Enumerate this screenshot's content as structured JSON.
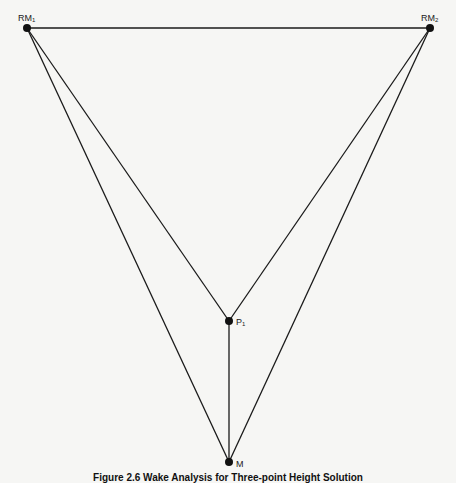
{
  "nodes": {
    "rm1": {
      "label": "RM",
      "sub": "1",
      "x": 27,
      "y": 28
    },
    "rm2": {
      "label": "RM",
      "sub": "2",
      "x": 430,
      "y": 28
    },
    "p1": {
      "label": "P",
      "sub": "1",
      "x": 229,
      "y": 321
    },
    "m": {
      "label": "M",
      "sub": "",
      "x": 229,
      "y": 462
    }
  },
  "edges": [
    [
      "rm1",
      "rm2"
    ],
    [
      "rm1",
      "p1"
    ],
    [
      "rm1",
      "m"
    ],
    [
      "rm2",
      "p1"
    ],
    [
      "rm2",
      "m"
    ],
    [
      "p1",
      "m"
    ]
  ],
  "caption": "Figure 2.6   Wake Analysis for Three-point Height Solution",
  "colors": {
    "line": "#1a1a1a",
    "node": "#111111",
    "background": "#f6f6f4"
  }
}
